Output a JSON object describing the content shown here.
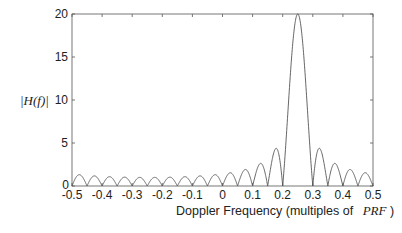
{
  "chart_data": {
    "type": "line",
    "title": "",
    "xlabel": "Doppler Frequency (multiples of PRF)",
    "xlabel_prefix": "Doppler Frequency (multiples of",
    "xlabel_math": "PRF",
    "xlabel_suffix": ")",
    "ylabel": "|H(f)|",
    "xlim": [
      -0.5,
      0.5
    ],
    "ylim": [
      0,
      20
    ],
    "grid": false,
    "legend": null,
    "xticks": [
      -0.5,
      -0.4,
      -0.3,
      -0.2,
      -0.1,
      0,
      0.1,
      0.2,
      0.3,
      0.4,
      0.5
    ],
    "xtick_labels": [
      "-0.5",
      "-0.4",
      "-0.3",
      "-0.2",
      "-0.1",
      "0",
      "0.1",
      "0.2",
      "0.3",
      "0.4",
      "0.5"
    ],
    "yticks": [
      0,
      5,
      10,
      15,
      20
    ],
    "ytick_labels": [
      "0",
      "5",
      "10",
      "15",
      "20"
    ],
    "series": [
      {
        "name": "|H(f)|",
        "description": "Dirichlet (periodic sinc) magnitude response, N=20 pulses, main lobe at f=0.25",
        "model": {
          "N": 20,
          "f0": 0.25
        },
        "x": [
          -0.5,
          -0.475,
          -0.45,
          -0.4,
          -0.35,
          -0.3,
          -0.25,
          -0.2,
          -0.15,
          -0.1,
          -0.05,
          0,
          0.025,
          0.05,
          0.075,
          0.1,
          0.125,
          0.15,
          0.175,
          0.2,
          0.225,
          0.25,
          0.275,
          0.3,
          0.325,
          0.35,
          0.375,
          0.4,
          0.425,
          0.45,
          0.475,
          0.5
        ],
        "values": [
          0,
          1.27,
          0,
          0,
          0,
          0,
          0,
          0,
          0,
          0,
          0,
          0,
          1.99,
          0,
          2.6,
          0,
          2.95,
          0,
          4.6,
          0,
          12.7,
          20,
          12.7,
          0,
          4.6,
          0,
          2.95,
          0,
          2.6,
          0,
          1.27,
          0
        ],
        "peak": {
          "x": 0.25,
          "y": 20
        },
        "null_spacing": 0.05,
        "sidelobe_floor": 1.27
      }
    ]
  }
}
